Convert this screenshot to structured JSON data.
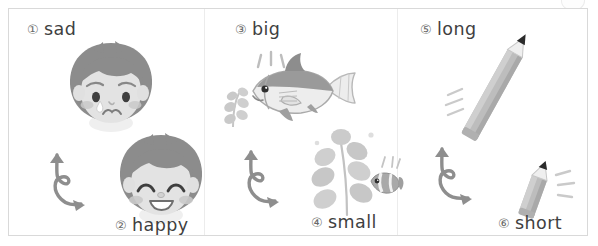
{
  "worksheet": {
    "type": "opposites-matching-worksheet",
    "style": "grayscale",
    "frame_border_color": "#d9d9d9",
    "background_color": "#ffffff",
    "text_color": "#3f3f3f",
    "number_color": "#6a6a6a",
    "art_color": "#9a9a9a",
    "arrow_color": "#8e8e8e"
  },
  "columns": [
    {
      "name": "emotions",
      "top": {
        "number": "①",
        "word": "sad",
        "illustration": "sad-boy-face-icon"
      },
      "arrow": "double-headed-curly-arrow-icon",
      "bottom": {
        "number": "②",
        "word": "happy",
        "illustration": "happy-boy-face-icon"
      }
    },
    {
      "name": "size-fish",
      "top": {
        "number": "③",
        "word": "big",
        "illustration": "big-fish-icon"
      },
      "arrow": "double-headed-curly-arrow-icon",
      "bottom": {
        "number": "④",
        "word": "small",
        "illustration": "small-clownfish-with-seaweed-icon"
      }
    },
    {
      "name": "length-pencil",
      "top": {
        "number": "⑤",
        "word": "long",
        "illustration": "long-pencil-icon"
      },
      "arrow": "double-headed-curly-arrow-icon",
      "bottom": {
        "number": "⑥",
        "word": "short",
        "illustration": "short-pencil-icon"
      }
    }
  ]
}
